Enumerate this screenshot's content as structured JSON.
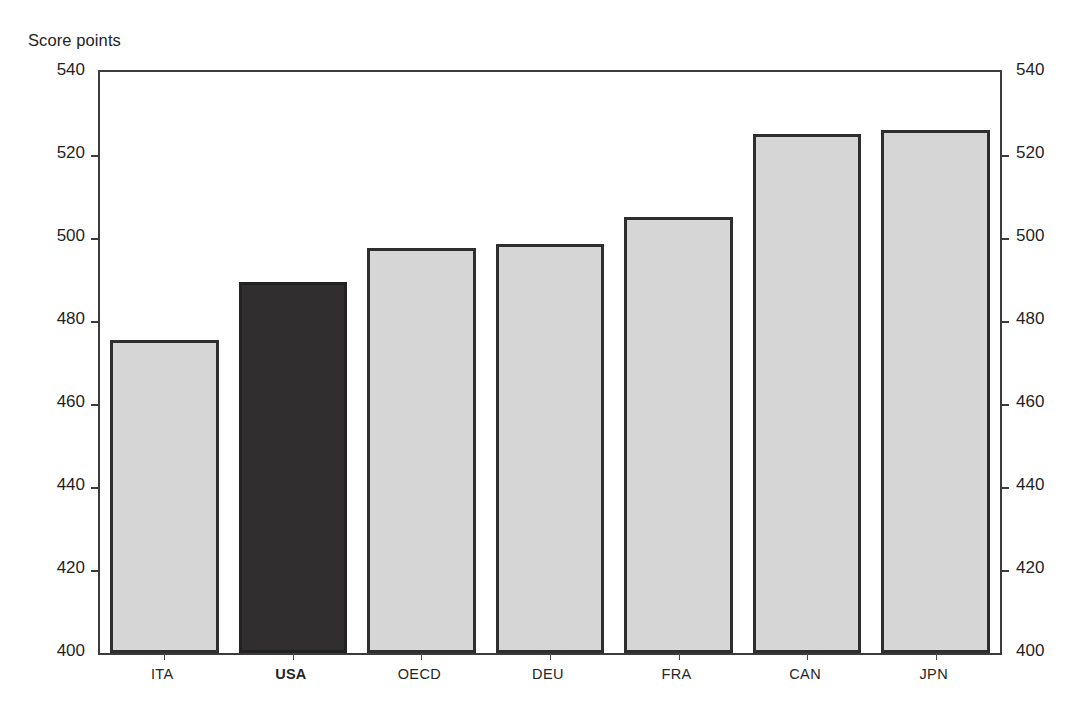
{
  "axis_caption": "Score points",
  "chart_data": {
    "type": "bar",
    "title": "",
    "subtitle": "",
    "xlabel": "",
    "ylabel": "Score points",
    "categories": [
      "ITA",
      "USA",
      "OECD",
      "DEU",
      "FRA",
      "CAN",
      "JPN"
    ],
    "values": [
      475.5,
      489.5,
      497.5,
      498.5,
      505,
      525,
      526
    ],
    "ylim": [
      400,
      540
    ],
    "yticks": [
      400,
      420,
      440,
      460,
      480,
      500,
      520,
      540
    ],
    "ytick_labels_left": [
      "400",
      "420",
      "440",
      "460",
      "480",
      "500",
      "520",
      "540"
    ],
    "ytick_labels_right": [
      "400",
      "420",
      "440",
      "460",
      "480",
      "500",
      "520",
      "540"
    ],
    "grid": false,
    "legend": null,
    "highlight_category": "USA",
    "bar_colors": {
      "default_fill": "#d6d6d6",
      "default_border": "#2e2e2e",
      "highlight_fill": "#302e2e",
      "highlight_border": "#232222"
    },
    "axis_color": "#3b3b3b",
    "background": "#ffffff",
    "bars": [
      {
        "label": "ITA",
        "value": 475.5,
        "highlight": false
      },
      {
        "label": "USA",
        "value": 489.5,
        "highlight": true
      },
      {
        "label": "OECD",
        "value": 497.5,
        "highlight": false
      },
      {
        "label": "DEU",
        "value": 498.5,
        "highlight": false
      },
      {
        "label": "FRA",
        "value": 505,
        "highlight": false
      },
      {
        "label": "CAN",
        "value": 525,
        "highlight": false
      },
      {
        "label": "JPN",
        "value": 526,
        "highlight": false
      }
    ]
  }
}
